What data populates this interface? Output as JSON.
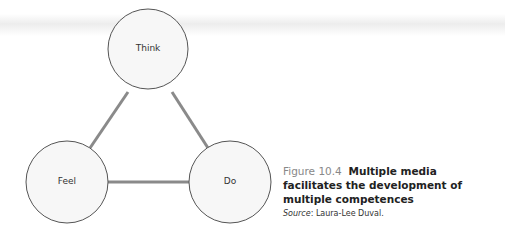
{
  "diagram": {
    "nodes": [
      {
        "id": "think",
        "label": "Think"
      },
      {
        "id": "feel",
        "label": "Feel"
      },
      {
        "id": "do",
        "label": "Do"
      }
    ],
    "edges": [
      {
        "from": "think",
        "to": "feel"
      },
      {
        "from": "think",
        "to": "do"
      },
      {
        "from": "feel",
        "to": "do"
      }
    ],
    "colors": {
      "edge": "#8a8a8a",
      "node_stroke": "#555555",
      "node_fill": "#f7f7f7"
    }
  },
  "caption": {
    "figure_number": "Figure 10.4",
    "title": "Multiple media facilitates the development of multiple competences",
    "source_label": "Source",
    "source_text": ": Laura-Lee Duval."
  }
}
